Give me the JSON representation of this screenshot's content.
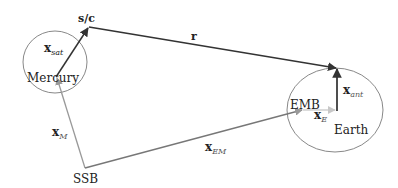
{
  "diagram": {
    "colors": {
      "dark_arrow": "#333333",
      "gray_arrow": "#999999",
      "light_arrow": "#c8c8c8",
      "circle": "#888888",
      "text": "#222222"
    },
    "bodies": {
      "mercury": {
        "label": "Mercury"
      },
      "earth": {
        "label": "Earth"
      }
    },
    "points": {
      "spacecraft": {
        "label": "s/c"
      },
      "ssb": {
        "label": "SSB"
      },
      "emb": {
        "label": "EMB"
      }
    },
    "vectors": {
      "r": {
        "base": "r",
        "sub": ""
      },
      "x_sat": {
        "base": "x",
        "sub": "sat"
      },
      "x_M": {
        "base": "x",
        "sub": "M"
      },
      "x_EM": {
        "base": "x",
        "sub": "EM"
      },
      "x_E": {
        "base": "x",
        "sub": "E"
      },
      "x_ant": {
        "base": "x",
        "sub": "ant"
      }
    }
  }
}
